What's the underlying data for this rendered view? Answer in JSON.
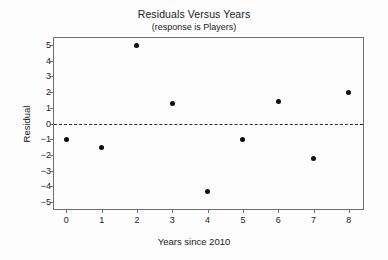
{
  "chart_data": {
    "type": "scatter",
    "title": "Residuals Versus Years",
    "subtitle": "(response is Players)",
    "xlabel": "Years since 2010",
    "ylabel": "Residual",
    "x": [
      0,
      1,
      2,
      3,
      4,
      5,
      6,
      7,
      8
    ],
    "values": [
      -1.0,
      -1.5,
      4.95,
      1.3,
      -4.35,
      -1.0,
      1.4,
      -2.25,
      2.0
    ],
    "series": [
      {
        "name": "Residual",
        "points": [
          {
            "x": 0,
            "y": -1.0
          },
          {
            "x": 1,
            "y": -1.5
          },
          {
            "x": 2,
            "y": 4.95
          },
          {
            "x": 3,
            "y": 1.3
          },
          {
            "x": 4,
            "y": -4.35
          },
          {
            "x": 5,
            "y": -1.0
          },
          {
            "x": 6,
            "y": 1.4
          },
          {
            "x": 7,
            "y": -2.25
          },
          {
            "x": 8,
            "y": 2.0
          }
        ]
      }
    ],
    "xlim": [
      -0.35,
      8.4
    ],
    "ylim": [
      -5.45,
      5.45
    ],
    "xticks": [
      0,
      1,
      2,
      3,
      4,
      5,
      6,
      7,
      8
    ],
    "xtick_labels": [
      "0",
      "1",
      "2",
      "3",
      "4",
      "5",
      "6",
      "7",
      "8"
    ],
    "yticks": [
      5,
      4,
      3,
      2,
      1,
      0,
      -1,
      -2,
      -3,
      -4,
      -5
    ],
    "ytick_labels": [
      "5",
      "4",
      "3",
      "2",
      "1",
      "0",
      "−1",
      "−2",
      "−3",
      "−4",
      "−5"
    ],
    "grid": false,
    "legend": null,
    "reference_lines": [
      {
        "name": "zero-line",
        "axis": "y",
        "value": 0,
        "style": "dashed"
      }
    ],
    "colors": {
      "marker": "#0d0d0d",
      "frame": "#6f6f6f",
      "reference_line": "#2b2b2b",
      "text": "#1a1a1a",
      "background": "#fdfdfd"
    }
  }
}
